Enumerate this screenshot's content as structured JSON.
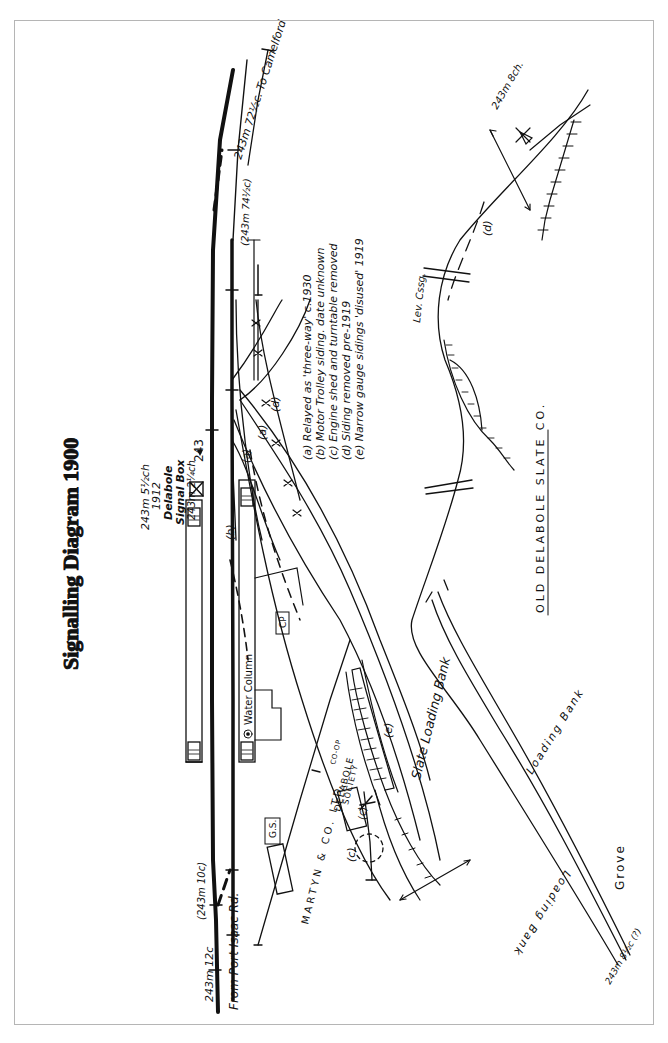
{
  "title": "Signalling Diagram 1900",
  "signal_box": {
    "mileage_1912": "243m 5½ch",
    "year": "1912",
    "name_line1": "Delabole",
    "name_line2": "Signal Box",
    "mileage": "243m 2¼ch"
  },
  "milepost": "243",
  "track_labels": {
    "to_camelford": "243m 72½c. To Camelford",
    "mileage_74": "(243m 74½c)",
    "mileage_10": "(243m 10c)",
    "mileage_12": "243m 12c",
    "from_port_isaac": "From Port Isaac Rd.",
    "branch_end": "243m 8ch.",
    "grove_mileage": "243m 8½c (?)"
  },
  "notes": [
    "(a) Relayed as 'three-way' c.1930",
    "(b) Motor Trolley siding. date unknown",
    "(c) Engine shed and turntable removed",
    "(d) Siding removed pre-1919",
    "(e) Narrow gauge sidings 'disused' 1919"
  ],
  "markers": {
    "a": "(a)",
    "b": "(b)",
    "c": "(c)",
    "d": "(d)",
    "e": "(e)"
  },
  "buildings": {
    "water_column": "Water Column",
    "cp": "CP",
    "gs": "G.S.",
    "martyn": "MARTYN & CO. LTD.",
    "coop_line1": "DELABOLE",
    "coop_line2": "CO-OP",
    "coop_line3": "SOCIETY"
  },
  "places": {
    "slate_loading_bank": "Slate Loading Bank",
    "loading_bank_1": "Loading Bank",
    "loading_bank_2": "Loading Bank",
    "grove": "Grove",
    "old_delabole": "OLD DELABOLE SLATE CO.",
    "lev_crossing": "Lev. Cssg."
  },
  "colors": {
    "ink": "#111111",
    "frame": "#b5b5b5",
    "background": "#ffffff"
  }
}
